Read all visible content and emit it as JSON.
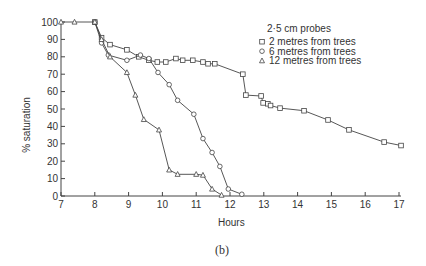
{
  "chart_data": {
    "type": "line",
    "title": "",
    "caption": "(b)",
    "xlabel": "Hours",
    "ylabel": "% saturation",
    "xlim": [
      7,
      17
    ],
    "ylim": [
      0,
      100
    ],
    "xticks": [
      7,
      8,
      9,
      10,
      11,
      12,
      13,
      14,
      15,
      16,
      17
    ],
    "yticks": [
      0,
      10,
      20,
      30,
      40,
      50,
      60,
      70,
      80,
      90,
      100
    ],
    "grid": false,
    "legend": {
      "title": "2·5 cm probes",
      "position": "upper-right",
      "entries": [
        {
          "marker": "square",
          "label": "2 metres from trees"
        },
        {
          "marker": "circle",
          "label": "6 metres from trees"
        },
        {
          "marker": "triangle",
          "label": "12 metres from trees"
        }
      ]
    },
    "series": [
      {
        "name": "2 metres from trees",
        "marker": "square",
        "x": [
          8.0,
          8.2,
          8.45,
          8.95,
          9.3,
          9.6,
          9.85,
          10.1,
          10.4,
          10.6,
          10.9,
          11.2,
          11.35,
          11.55,
          12.38,
          12.47,
          12.92,
          12.98,
          13.12,
          13.2,
          13.48,
          14.19,
          14.9,
          15.52,
          16.56,
          17.06
        ],
        "y": [
          100,
          91,
          87,
          84,
          80,
          78,
          77,
          77,
          79,
          78,
          78,
          77,
          76,
          76,
          70,
          58,
          57.5,
          53.5,
          53,
          52,
          50.5,
          49,
          43.7,
          38,
          31,
          29
        ]
      },
      {
        "name": "6 metres from trees",
        "marker": "circle",
        "x": [
          8.0,
          8.2,
          8.4,
          8.95,
          9.35,
          9.6,
          9.87,
          10.2,
          10.45,
          10.93,
          11.2,
          11.47,
          11.7,
          11.95,
          12.35
        ],
        "y": [
          100,
          88,
          81,
          78,
          81,
          79,
          71,
          64,
          55,
          47,
          33,
          25,
          17,
          4,
          1
        ]
      },
      {
        "name": "12 metres from trees",
        "marker": "triangle",
        "x": [
          7.0,
          7.4,
          8.0,
          8.2,
          8.45,
          8.95,
          9.2,
          9.45,
          9.9,
          10.2,
          10.45,
          11.0,
          11.2,
          11.47,
          11.75
        ],
        "y": [
          100,
          100,
          100,
          90,
          80,
          71,
          58,
          44,
          38,
          15,
          12.5,
          12.5,
          12,
          4,
          0.5
        ]
      }
    ]
  }
}
